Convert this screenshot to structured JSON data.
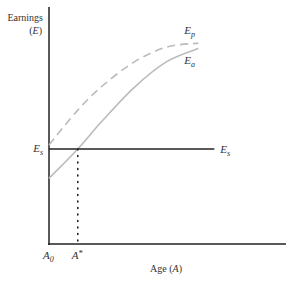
{
  "chart_data": {
    "type": "line",
    "title": "",
    "ylabel_line1": "Earnings",
    "ylabel_line2": "(E)",
    "xlabel": "Age (A)",
    "x_range": [
      0,
      10
    ],
    "y_range": [
      0,
      10
    ],
    "x_ticks": [
      {
        "label_main": "A",
        "label_sub": "0",
        "x": 0
      },
      {
        "label_main": "A",
        "label_sup": "*",
        "x": 1.35
      }
    ],
    "y_ticks": [
      {
        "label_main": "E",
        "label_sub": "s",
        "y": 3.55
      }
    ],
    "series": [
      {
        "name": "E_p",
        "label_main": "E",
        "label_sub": "p",
        "style": "dashed",
        "color": "#bbbbbb",
        "x": [
          0,
          1.35,
          2.5,
          4,
          5.5,
          7
        ],
        "y": [
          3.7,
          5.0,
          5.9,
          6.8,
          7.35,
          7.5
        ]
      },
      {
        "name": "E_a",
        "label_main": "E",
        "label_sub": "a",
        "style": "solid",
        "color": "#bbbbbb",
        "x": [
          0,
          1.35,
          2.5,
          4,
          5.5,
          7
        ],
        "y": [
          2.45,
          3.55,
          4.6,
          5.85,
          6.8,
          7.3
        ]
      },
      {
        "name": "E_s",
        "label_main": "E",
        "label_sub": "s",
        "style": "solid",
        "color": "#222222",
        "x": [
          0,
          7.75
        ],
        "y": [
          3.55,
          3.55
        ]
      }
    ],
    "annotations": [
      {
        "type": "dotted-vertical",
        "x": 1.35,
        "from_y": 0,
        "to_y": 3.55,
        "meaning": "A* where E_a crosses E_s"
      }
    ],
    "grid": false,
    "legend": "none"
  }
}
